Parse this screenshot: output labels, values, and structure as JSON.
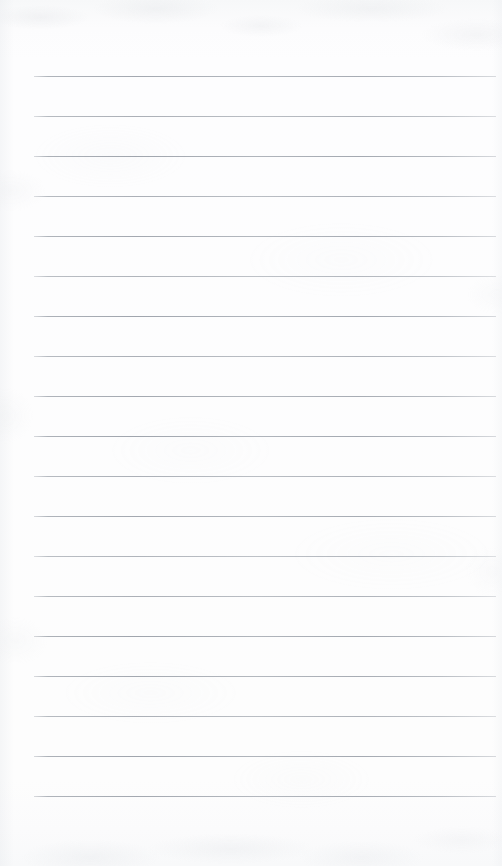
{
  "document": {
    "kind": "lined-paper",
    "title": "Lined Notebook Paper",
    "page_width": 502,
    "page_height": 866,
    "background_color": "#fdfdfd",
    "content_text": "",
    "is_blank": true
  },
  "ruling": {
    "line_color": "#a8adb4",
    "line_thickness_px": 1,
    "line_spacing_px": 40,
    "line_count": 19,
    "left_margin_px": 34,
    "right_edge_px": 496,
    "first_line_y_px": 76,
    "last_line_y_px": 796,
    "lines": [
      {
        "index": 1,
        "y": 76,
        "tone": "t-a"
      },
      {
        "index": 2,
        "y": 116,
        "tone": "t-b"
      },
      {
        "index": 3,
        "y": 156,
        "tone": "t-c"
      },
      {
        "index": 4,
        "y": 196,
        "tone": "t-b"
      },
      {
        "index": 5,
        "y": 236,
        "tone": "t-a"
      },
      {
        "index": 6,
        "y": 276,
        "tone": "t-d"
      },
      {
        "index": 7,
        "y": 316,
        "tone": "t-c"
      },
      {
        "index": 8,
        "y": 356,
        "tone": "t-b"
      },
      {
        "index": 9,
        "y": 396,
        "tone": "t-a"
      },
      {
        "index": 10,
        "y": 436,
        "tone": "t-c"
      },
      {
        "index": 11,
        "y": 476,
        "tone": "t-b"
      },
      {
        "index": 12,
        "y": 516,
        "tone": "t-a"
      },
      {
        "index": 13,
        "y": 556,
        "tone": "t-d"
      },
      {
        "index": 14,
        "y": 596,
        "tone": "t-b"
      },
      {
        "index": 15,
        "y": 636,
        "tone": "t-c"
      },
      {
        "index": 16,
        "y": 676,
        "tone": "t-a"
      },
      {
        "index": 17,
        "y": 716,
        "tone": "t-b"
      },
      {
        "index": 18,
        "y": 756,
        "tone": "t-c"
      },
      {
        "index": 19,
        "y": 796,
        "tone": "t-a"
      }
    ]
  },
  "texture": {
    "grain_color": "#c6cad0",
    "top_edge_shade": "#f7f8f9",
    "bottom_edge_shade": "#f8f9fa"
  }
}
